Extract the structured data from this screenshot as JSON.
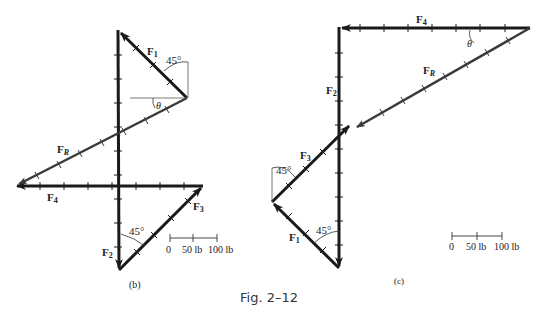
{
  "figure": {
    "caption": "Fig. 2–12",
    "panels": [
      {
        "id": "b",
        "label": "(b)",
        "vectors": {
          "F1": "F",
          "F1_sub": "1",
          "F2": "F",
          "F2_sub": "2",
          "F3": "F",
          "F3_sub": "3",
          "F4": "F",
          "F4_sub": "4",
          "FR": "F",
          "FR_sub": "R"
        },
        "angles": {
          "a1": "45°",
          "a2": "45°",
          "theta": "θ"
        },
        "scale": {
          "t0": "0",
          "t1": "50 lb",
          "t2": "100 lb"
        }
      },
      {
        "id": "c",
        "label": "(c)",
        "vectors": {
          "F1": "F",
          "F1_sub": "1",
          "F2": "F",
          "F2_sub": "2",
          "F3": "F",
          "F3_sub": "3",
          "F4": "F",
          "F4_sub": "4",
          "FR": "F",
          "FR_sub": "R"
        },
        "angles": {
          "a1": "45°",
          "a2": "45°",
          "theta": "θ"
        },
        "scale": {
          "t0": "0",
          "t1": "50 lb",
          "t2": "100 lb"
        }
      }
    ]
  },
  "colors": {
    "vector": "#1a1a1a",
    "resultant": "#3a3a3a",
    "thin": "#555555"
  }
}
